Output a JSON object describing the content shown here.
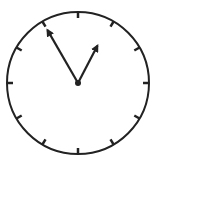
{
  "clock": {
    "center": [
      78,
      83
    ],
    "radius": 71,
    "time": {
      "hour": 12,
      "minute": 55
    },
    "stroke_color": "#222222",
    "background": "#ffffff",
    "tick_count": 12,
    "minute_hand_length": 61,
    "hour_hand_length": 42
  }
}
